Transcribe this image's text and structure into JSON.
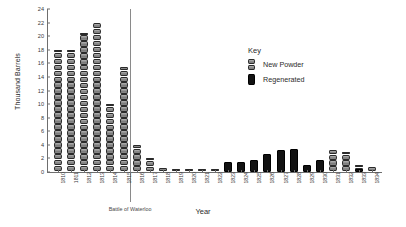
{
  "chart_data": {
    "type": "bar",
    "title": "",
    "xlabel": "Year",
    "ylabel": "Thousand Barrels",
    "ylim": [
      0,
      24
    ],
    "ytick_step": 2,
    "yticks": [
      0,
      2,
      4,
      6,
      8,
      10,
      12,
      14,
      16,
      18,
      20,
      22,
      24
    ],
    "grid": false,
    "legend_position": "right-top",
    "legend_title": "Key",
    "series": [
      {
        "name": "New Powder",
        "color": "#8d8d8d",
        "values": [
          18.0,
          18.0,
          20.5,
          22.0,
          10.0,
          15.5,
          4.0,
          2.0,
          0.6,
          0.5,
          0.5,
          0.3,
          0.5,
          0,
          0,
          0,
          0,
          0,
          0,
          0,
          0,
          3.2,
          3.0,
          1.0,
          0.7
        ]
      },
      {
        "name": "Regenerated",
        "color": "#121212",
        "values": [
          0,
          0,
          0,
          0,
          0,
          0,
          0,
          0,
          0,
          0,
          0,
          0,
          0,
          1.5,
          1.5,
          1.8,
          2.6,
          3.2,
          3.4,
          1.0,
          1.8,
          0,
          0,
          0.4,
          0
        ]
      }
    ],
    "categories": [
      "1810",
      "1811",
      "1812",
      "1813",
      "1814",
      "1815",
      "1816",
      "1817",
      "1818",
      "1819",
      "1820",
      "1821",
      "1822",
      "1823",
      "1824",
      "1825",
      "1826",
      "1827",
      "1828",
      "1829",
      "1830",
      "1831",
      "1832",
      "1833",
      "1834"
    ],
    "annotations": [
      {
        "label": "Battle of Waterloo",
        "after_category": "1815"
      }
    ]
  },
  "legend": {
    "title": "Key",
    "entries": [
      {
        "label": "New Powder",
        "marker": "segmented-barrel"
      },
      {
        "label": "Regenerated",
        "marker": "solid-block"
      }
    ]
  },
  "axes": {
    "y_title": "Thousand Barrels",
    "x_title": "Year"
  }
}
